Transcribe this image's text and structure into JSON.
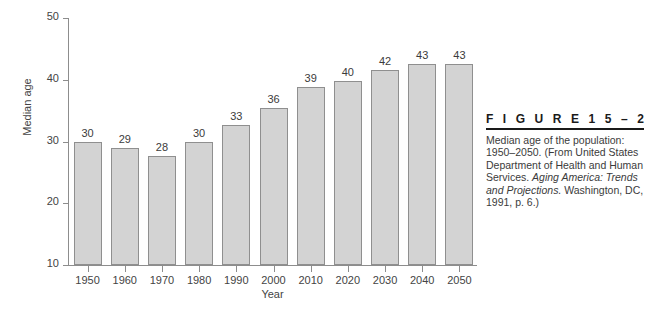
{
  "chart_data": {
    "type": "bar",
    "title": "",
    "xlabel": "Year",
    "ylabel": "Median age",
    "categories": [
      "1950",
      "1960",
      "1970",
      "1980",
      "1990",
      "2000",
      "2010",
      "2020",
      "2030",
      "2040",
      "2050"
    ],
    "values": [
      30,
      29,
      28,
      30,
      33,
      36,
      39,
      40,
      42,
      43,
      43
    ],
    "bar_tops": [
      29.9,
      29.0,
      27.7,
      29.9,
      32.6,
      35.5,
      38.8,
      39.8,
      41.6,
      42.5,
      42.6
    ],
    "data_labels": [
      "30",
      "29",
      "28",
      "30",
      "33",
      "36",
      "39",
      "40",
      "42",
      "43",
      "43"
    ],
    "ylim": [
      10,
      50
    ],
    "yticks": [
      10,
      20,
      30,
      40,
      50
    ],
    "ytick_labels": [
      "10",
      "20",
      "30",
      "40",
      "50"
    ],
    "grid": false,
    "legend": false,
    "bar_color": "#d3d3d3",
    "bar_border_color": "#8f8f8f",
    "axis_color": "#8d8d8d"
  },
  "caption": {
    "figure_label": "F I G U R E   1 5 – 2",
    "line1": "Median age of the population:",
    "line2": "1950–2050. (From United States",
    "line3": "Department of Health and Human",
    "line4_plain": "Services. ",
    "line4_italic": "Aging America: Trends",
    "line5_italic": "and Projections.",
    "line5_plain": " Washington, DC,",
    "line6": "1991, p. 6.)"
  }
}
